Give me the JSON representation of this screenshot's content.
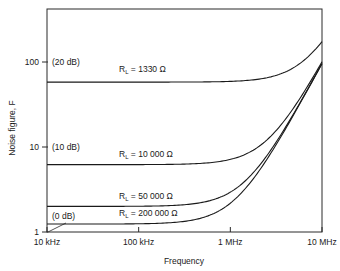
{
  "chart_data": {
    "type": "line",
    "title": "",
    "xlabel": "Frequency",
    "ylabel": "Noise figure, F",
    "xscale": "log",
    "yscale": "log",
    "xlim": [
      10000,
      10000000
    ],
    "ylim": [
      1,
      420
    ],
    "x_ticks": [
      {
        "value": 10000,
        "label": "10 kHz"
      },
      {
        "value": 100000,
        "label": "100 kHz"
      },
      {
        "value": 1000000,
        "label": "1 MHz"
      },
      {
        "value": 10000000,
        "label": "10 MHz"
      }
    ],
    "y_ticks": [
      {
        "value": 1,
        "label": "1",
        "db_label": "(0 dB)"
      },
      {
        "value": 10,
        "label": "10",
        "db_label": "(10 dB)"
      },
      {
        "value": 100,
        "label": "100",
        "db_label": "(20 dB)"
      }
    ],
    "grid": false,
    "legend": "inline labels",
    "series": [
      {
        "name": "RL = 1330 Ω",
        "label_main": "R",
        "label_sub": "L",
        "label_value": " = 1330 Ω",
        "flat_value": 58,
        "corner_freq": 930000,
        "x": [
          10000,
          100000,
          1000000,
          2000000,
          5000000,
          10000000
        ],
        "values": [
          58,
          58,
          59,
          63,
          87,
          172
        ]
      },
      {
        "name": "RL = 10000 Ω",
        "label_main": "R",
        "label_sub": "L",
        "label_value": " = 10 000 Ω",
        "flat_value": 6.2,
        "corner_freq": 1030000,
        "x": [
          10000,
          100000,
          1000000,
          2000000,
          5000000,
          10000000
        ],
        "values": [
          6.2,
          6.2,
          7.1,
          10,
          30,
          100
        ]
      },
      {
        "name": "RL = 50000 Ω",
        "label_main": "R",
        "label_sub": "L",
        "label_value": " = 50 000 Ω",
        "flat_value": 2.0,
        "corner_freq": 1030000,
        "x": [
          10000,
          100000,
          1000000,
          2000000,
          5000000,
          10000000
        ],
        "values": [
          2.0,
          2.0,
          2.9,
          5.8,
          25.6,
          96
        ]
      },
      {
        "name": "RL = 200000 Ω",
        "label_main": "R",
        "label_sub": "L",
        "label_value": " = 200 000 Ω",
        "flat_value": 1.24,
        "corner_freq": 1030000,
        "x": [
          10000,
          100000,
          1000000,
          2000000,
          5000000,
          10000000
        ],
        "values": [
          1.24,
          1.25,
          2.2,
          5.0,
          24.8,
          95
        ]
      }
    ]
  },
  "layout": {
    "plot_left": 47,
    "plot_right": 322,
    "plot_top": 9,
    "plot_bottom": 232,
    "px_per_decade_y": 85
  }
}
